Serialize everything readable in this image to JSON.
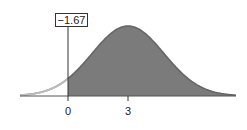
{
  "chart_data": {
    "type": "area",
    "title": "",
    "distribution": {
      "mean": 3,
      "sd": 1.8
    },
    "shaded_region": {
      "from": 0,
      "to": "inf"
    },
    "annotation": {
      "label": "−1.67",
      "x": 0
    },
    "x_ticks": [
      {
        "value": 0,
        "label": "0"
      },
      {
        "value": 3,
        "label": "3"
      }
    ],
    "xlabel": "",
    "ylabel": "",
    "colors": {
      "shaded": "#7a7a7a",
      "curve": "#555555",
      "unshaded_curve": "#aaaaaa"
    }
  },
  "labels": {
    "annotation": "−1.67",
    "tick_0": "0",
    "tick_3": "3"
  }
}
